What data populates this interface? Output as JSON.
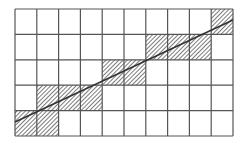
{
  "diagram": {
    "type": "grid-line-rasterization",
    "grid": {
      "cols": 10,
      "rows": 5,
      "x0": 15,
      "y0": 9,
      "width": 218,
      "height": 127,
      "line_color": "#555555",
      "background": "#ffffff"
    },
    "shaded_cells": [
      {
        "col": 9,
        "row": 0
      },
      {
        "col": 6,
        "row": 1
      },
      {
        "col": 7,
        "row": 1
      },
      {
        "col": 8,
        "row": 1
      },
      {
        "col": 4,
        "row": 2
      },
      {
        "col": 5,
        "row": 2
      },
      {
        "col": 1,
        "row": 3
      },
      {
        "col": 2,
        "row": 3
      },
      {
        "col": 3,
        "row": 3
      },
      {
        "col": 0,
        "row": 4
      },
      {
        "col": 1,
        "row": 4
      }
    ],
    "hatch_color": "#444444",
    "line": {
      "x1": 15,
      "y1": 122,
      "x2": 233,
      "y2": 20,
      "color": "#333333"
    }
  }
}
